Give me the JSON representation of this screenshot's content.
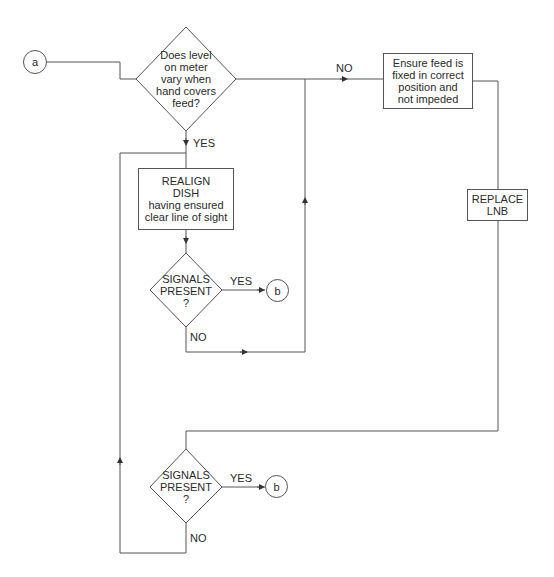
{
  "connectors": {
    "start": "a",
    "end_1": "b",
    "end_2": "b"
  },
  "decisions": [
    {
      "id": "level-varies",
      "text": "Does level\non meter\nvary when\nhand covers\nfeed?"
    },
    {
      "id": "signals-present-1",
      "text": "SIGNALS\nPRESENT\n?"
    },
    {
      "id": "signals-present-2",
      "text": "SIGNALS\nPRESENT\n?"
    }
  ],
  "processes": [
    {
      "id": "ensure-feed",
      "text": "Ensure feed is\nfixed in correct\nposition and\nnot impeded"
    },
    {
      "id": "realign-dish",
      "title": "REALIGN\nDISH",
      "text": "having ensured\nclear line of sight"
    },
    {
      "id": "replace-lnb",
      "text": "REPLACE\nLNB"
    }
  ],
  "edge_labels": {
    "level_no": "NO",
    "level_yes": "YES",
    "signals1_yes": "YES",
    "signals1_no": "NO",
    "signals2_yes": "YES",
    "signals2_no": "NO"
  },
  "colors": {
    "line": "#555555",
    "text": "#2a2a2a",
    "background": "#ffffff"
  }
}
